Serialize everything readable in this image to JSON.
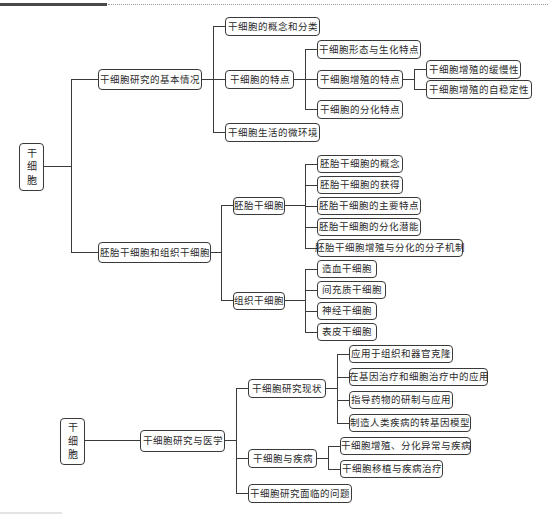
{
  "header": {
    "bar_color": "#4a4a4a"
  },
  "map1": {
    "root": {
      "chars": [
        "干",
        "细",
        "胞"
      ]
    },
    "branch1": {
      "label": "干细胞研究的基本情况",
      "children": {
        "concept": "干细胞的概念和分类",
        "features": {
          "label": "干细胞的特点",
          "children": {
            "morph": "干细胞形态与生化特点",
            "prolif": {
              "label": "干细胞增殖的特点",
              "children": [
                "干细胞增殖的缓慢性",
                "干细胞增殖的自稳定性"
              ]
            },
            "diff": "干细胞的分化特点"
          }
        },
        "niche": "干细胞生活的微环境"
      }
    },
    "branch2": {
      "label": "胚胎干细胞和组织干细胞",
      "embryonic": {
        "label": "胚胎干细胞",
        "children": [
          "胚胎干细胞的概念",
          "胚胎干细胞的获得",
          "胚胎干细胞的主要特点",
          "胚胎干细胞的分化潜能",
          "胚胎干细胞增殖与分化的分子机制"
        ]
      },
      "tissue": {
        "label": "组织干细胞",
        "children": [
          "造血干细胞",
          "间充质干细胞",
          "神经干细胞",
          "表皮干细胞"
        ]
      }
    }
  },
  "map2": {
    "root": {
      "chars": [
        "干",
        "细",
        "胞"
      ]
    },
    "branch": {
      "label": "干细胞研究与医学",
      "status": {
        "label": "干细胞研究现状",
        "children": [
          "应用于组织和器官克隆",
          "在基因治疗和细胞治疗中的应用",
          "指导药物的研制与应用",
          "制造人类疾病的转基因模型"
        ]
      },
      "disease": {
        "label": "干细胞与疾病",
        "children": [
          "干细胞增殖、分化异常与疾病",
          "干细胞移植与疾病治疗"
        ]
      },
      "problems": {
        "label": "干细胞研究面临的问题"
      }
    }
  }
}
